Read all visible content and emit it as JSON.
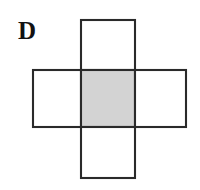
{
  "figure": {
    "label": "D",
    "label_position": {
      "x": 18,
      "y": 18
    },
    "caption": "",
    "type": "cube-net-cross",
    "background_color": "#ffffff",
    "stroke_color": "#2a2a2a",
    "stroke_width": 2.1,
    "unfilled_color": "#ffffff",
    "shaded_color": "#d3d3d3",
    "cells": [
      {
        "name": "top-square",
        "position": "top",
        "x": 81,
        "y": 20,
        "width": 54,
        "height": 50,
        "fill": "#ffffff",
        "shaded": false
      },
      {
        "name": "left-square",
        "position": "left",
        "x": 33,
        "y": 70,
        "width": 48,
        "height": 57,
        "fill": "#ffffff",
        "shaded": false
      },
      {
        "name": "center-square",
        "position": "center",
        "x": 81,
        "y": 70,
        "width": 54,
        "height": 57,
        "fill": "#d3d3d3",
        "shaded": true
      },
      {
        "name": "right-square",
        "position": "right",
        "x": 135,
        "y": 70,
        "width": 51,
        "height": 57,
        "fill": "#ffffff",
        "shaded": false
      },
      {
        "name": "bottom-square",
        "position": "bottom",
        "x": 81,
        "y": 127,
        "width": 54,
        "height": 51,
        "fill": "#ffffff",
        "shaded": false
      }
    ]
  }
}
